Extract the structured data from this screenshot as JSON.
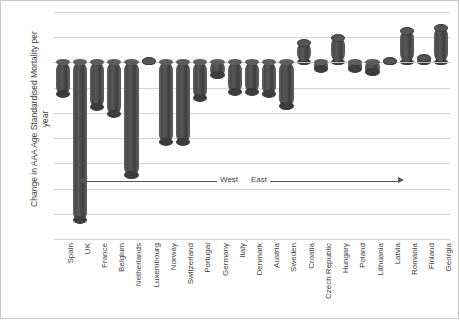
{
  "chart_data": {
    "type": "bar",
    "title": "",
    "xlabel": "",
    "ylabel": "Change in AAA Age Standardised Mortality per year",
    "ylim": [
      -0.7,
      0.2
    ],
    "ytick_labels": [
      "0.2",
      "0.1",
      "0",
      "-0.1",
      "-0.2",
      "-0.3",
      "-0.4",
      "-0.5",
      "-0.6",
      "-0.7"
    ],
    "ytick_values": [
      0.2,
      0.1,
      0,
      -0.1,
      -0.2,
      -0.3,
      -0.4,
      -0.5,
      -0.6,
      -0.7
    ],
    "grid": true,
    "legend": "none",
    "bar_color": "#4d4d4d",
    "bar_style": "cylinder",
    "categories": [
      "Spain",
      "UK",
      "France",
      "Belgium",
      "Netherlands",
      "Luxembourg",
      "Norway",
      "Switzerland",
      "Portugal",
      "Germany",
      "Italy",
      "Denmark",
      "Austria",
      "Sweden",
      "Croatia",
      "Czech Republic",
      "Hungary",
      "Poland",
      "Lithuania",
      "Latvia",
      "Romania",
      "Finland",
      "Georgia"
    ],
    "values": [
      -0.13,
      -0.63,
      -0.18,
      -0.21,
      -0.45,
      0.01,
      -0.32,
      -0.32,
      -0.145,
      -0.055,
      -0.12,
      -0.12,
      -0.13,
      -0.175,
      0.08,
      -0.03,
      0.1,
      -0.03,
      -0.04,
      0.01,
      0.13,
      0.02,
      0.14
    ],
    "annotations": [
      {
        "label": "West",
        "direction": "left",
        "value_axis_position": -0.47
      },
      {
        "label": "East",
        "direction": "right",
        "value_axis_position": -0.47
      }
    ]
  }
}
